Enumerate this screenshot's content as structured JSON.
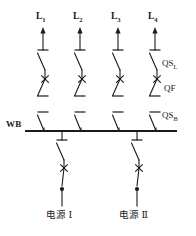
{
  "diagram": {
    "type": "electrical-single-line",
    "colors": {
      "line": "#1a1a1a",
      "background": "#ffffff"
    },
    "busbar": {
      "label": "WB",
      "x_start": 25,
      "x_end": 177,
      "y": 131
    },
    "feeders": [
      {
        "id": "L1",
        "base": "L",
        "sub": "1",
        "x": 43
      },
      {
        "id": "L2",
        "base": "L",
        "sub": "2",
        "x": 80
      },
      {
        "id": "L3",
        "base": "L",
        "sub": "3",
        "x": 118
      },
      {
        "id": "L4",
        "base": "L",
        "sub": "4",
        "x": 155
      }
    ],
    "device_labels": [
      {
        "base": "QS",
        "sub": "L",
        "name": "line-disconnector"
      },
      {
        "base": "QF",
        "sub": "",
        "name": "circuit-breaker"
      },
      {
        "base": "QS",
        "sub": "B",
        "name": "bus-disconnector"
      }
    ],
    "sources": [
      {
        "base": "电源",
        "numeral": "Ⅰ",
        "x": 62
      },
      {
        "base": "电源",
        "numeral": "Ⅱ",
        "x": 137
      }
    ]
  }
}
